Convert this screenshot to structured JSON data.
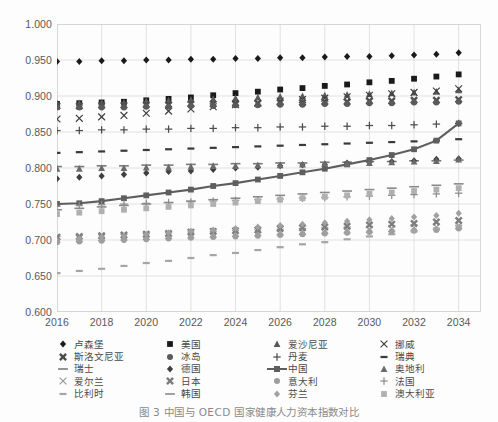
{
  "caption": "图 3 中国与 OECD 国家健康人力资本指数对比",
  "axes": {
    "y_ticks": [
      "1.000",
      "0.950",
      "0.900",
      "0.850",
      "0.800",
      "0.750",
      "0.700",
      "0.650",
      "0.600"
    ],
    "x_ticks": [
      "2016",
      "2018",
      "2020",
      "2022",
      "2024",
      "2026",
      "2028",
      "2030",
      "2032",
      "2034"
    ]
  },
  "legend": {
    "rows": [
      [
        {
          "label": "卢森堡",
          "marker": "diamond",
          "color": "#1a1a1a"
        },
        {
          "label": "美国",
          "marker": "square",
          "color": "#1a1a1a"
        },
        {
          "label": "爱沙尼亚",
          "marker": "triangle",
          "color": "#595959"
        },
        {
          "label": "挪威",
          "marker": "x-thin",
          "color": "#3f3f3f"
        }
      ],
      [
        {
          "label": "斯洛文尼亚",
          "marker": "x-bold",
          "color": "#4d4d4d"
        },
        {
          "label": "冰岛",
          "marker": "circle",
          "color": "#5a5a5a"
        },
        {
          "label": "丹麦",
          "marker": "plus",
          "color": "#4d4d4d"
        },
        {
          "label": "瑞典",
          "marker": "dash",
          "color": "#3a3a3a"
        }
      ],
      [
        {
          "label": "瑞士",
          "marker": "dash-long",
          "color": "#7a7a7a"
        },
        {
          "label": "德国",
          "marker": "diamond",
          "color": "#3f3f3f"
        },
        {
          "label": "中国",
          "marker": "line-square",
          "color": "#5e5e5e"
        },
        {
          "label": "奥地利",
          "marker": "triangle",
          "color": "#6a6a6a"
        }
      ],
      [
        {
          "label": "爱尔兰",
          "marker": "x-thin",
          "color": "#9a9a9a"
        },
        {
          "label": "日本",
          "marker": "x-bold",
          "color": "#7d7d7d"
        },
        {
          "label": "意大利",
          "marker": "circle",
          "color": "#9e9e9e"
        },
        {
          "label": "法国",
          "marker": "plus",
          "color": "#8d8d8d"
        }
      ],
      [
        {
          "label": "比利时",
          "marker": "dash",
          "color": "#a5a5a5"
        },
        {
          "label": "韩国",
          "marker": "dash-long",
          "color": "#8a8a8a"
        },
        {
          "label": "芬兰",
          "marker": "diamond",
          "color": "#a0a0a0"
        },
        {
          "label": "澳大利亚",
          "marker": "square",
          "color": "#b0b0b0"
        }
      ]
    ]
  },
  "chart_data": {
    "type": "scatter",
    "title": "",
    "xlabel": "",
    "ylabel": "",
    "xlim": [
      2016,
      2035
    ],
    "ylim": [
      0.6,
      1.0
    ],
    "ytick_step": 0.05,
    "grid": true,
    "legend_position": "bottom",
    "x": [
      2016,
      2017,
      2018,
      2019,
      2020,
      2021,
      2022,
      2023,
      2024,
      2025,
      2026,
      2027,
      2028,
      2029,
      2030,
      2031,
      2032,
      2033,
      2034
    ],
    "series": [
      {
        "name": "卢森堡",
        "marker": "diamond",
        "color": "#1a1a1a",
        "values": [
          0.948,
          0.948,
          0.949,
          0.949,
          0.95,
          0.95,
          0.951,
          0.951,
          0.952,
          0.952,
          0.953,
          0.953,
          0.954,
          0.955,
          0.955,
          0.956,
          0.957,
          0.958,
          0.96
        ]
      },
      {
        "name": "美国",
        "marker": "square",
        "color": "#1a1a1a",
        "values": [
          0.889,
          0.89,
          0.891,
          0.892,
          0.894,
          0.896,
          0.898,
          0.901,
          0.904,
          0.906,
          0.909,
          0.911,
          0.914,
          0.916,
          0.919,
          0.921,
          0.924,
          0.927,
          0.93
        ]
      },
      {
        "name": "爱沙尼亚",
        "marker": "triangle",
        "color": "#595959",
        "values": [
          0.89,
          0.89,
          0.891,
          0.891,
          0.893,
          0.894,
          0.895,
          0.896,
          0.897,
          0.898,
          0.899,
          0.9,
          0.901,
          0.902,
          0.903,
          0.904,
          0.905,
          0.906,
          0.908
        ]
      },
      {
        "name": "挪威",
        "marker": "x-thin",
        "color": "#3f3f3f",
        "values": [
          0.868,
          0.869,
          0.871,
          0.873,
          0.876,
          0.879,
          0.882,
          0.885,
          0.888,
          0.89,
          0.893,
          0.895,
          0.897,
          0.899,
          0.901,
          0.903,
          0.905,
          0.907,
          0.91
        ]
      },
      {
        "name": "斯洛文尼亚",
        "marker": "x-bold",
        "color": "#4d4d4d",
        "values": [
          0.886,
          0.886,
          0.887,
          0.887,
          0.888,
          0.888,
          0.889,
          0.889,
          0.89,
          0.89,
          0.891,
          0.891,
          0.892,
          0.892,
          0.893,
          0.893,
          0.894,
          0.894,
          0.895
        ]
      },
      {
        "name": "冰岛",
        "marker": "circle",
        "color": "#5a5a5a",
        "values": [
          0.884,
          0.884,
          0.884,
          0.884,
          0.885,
          0.885,
          0.886,
          0.886,
          0.887,
          0.887,
          0.888,
          0.888,
          0.889,
          0.889,
          0.89,
          0.89,
          0.891,
          0.891,
          0.892
        ]
      },
      {
        "name": "丹麦",
        "marker": "plus",
        "color": "#4d4d4d",
        "values": [
          0.852,
          0.852,
          0.853,
          0.853,
          0.854,
          0.854,
          0.855,
          0.855,
          0.856,
          0.856,
          0.857,
          0.857,
          0.858,
          0.858,
          0.859,
          0.859,
          0.86,
          0.861,
          0.862
        ]
      },
      {
        "name": "瑞典",
        "marker": "dash",
        "color": "#3a3a3a",
        "values": [
          0.821,
          0.822,
          0.823,
          0.824,
          0.825,
          0.826,
          0.827,
          0.828,
          0.829,
          0.83,
          0.831,
          0.832,
          0.833,
          0.834,
          0.835,
          0.836,
          0.837,
          0.838,
          0.84
        ]
      },
      {
        "name": "瑞士",
        "marker": "dash-long",
        "color": "#7a7a7a",
        "values": [
          0.802,
          0.802,
          0.803,
          0.803,
          0.804,
          0.804,
          0.805,
          0.805,
          0.806,
          0.806,
          0.807,
          0.807,
          0.808,
          0.808,
          0.809,
          0.809,
          0.81,
          0.81,
          0.811
        ]
      },
      {
        "name": "德国",
        "marker": "diamond",
        "color": "#3f3f3f",
        "values": [
          0.785,
          0.787,
          0.789,
          0.791,
          0.793,
          0.795,
          0.796,
          0.798,
          0.8,
          0.801,
          0.803,
          0.804,
          0.805,
          0.807,
          0.808,
          0.809,
          0.81,
          0.812,
          0.813
        ]
      },
      {
        "name": "中国",
        "marker": "line-square",
        "color": "#5e5e5e",
        "values": [
          0.75,
          0.751,
          0.754,
          0.758,
          0.762,
          0.766,
          0.77,
          0.775,
          0.779,
          0.784,
          0.789,
          0.794,
          0.799,
          0.805,
          0.811,
          0.818,
          0.826,
          0.838,
          0.862
        ]
      },
      {
        "name": "奥地利",
        "marker": "triangle",
        "color": "#6a6a6a",
        "values": [
          0.799,
          0.799,
          0.8,
          0.8,
          0.801,
          0.801,
          0.802,
          0.803,
          0.803,
          0.804,
          0.804,
          0.805,
          0.806,
          0.806,
          0.807,
          0.808,
          0.809,
          0.81,
          0.812
        ]
      },
      {
        "name": "爱尔兰",
        "marker": "x-thin",
        "color": "#9a9a9a",
        "values": [
          0.701,
          0.702,
          0.703,
          0.704,
          0.705,
          0.706,
          0.707,
          0.708,
          0.709,
          0.71,
          0.711,
          0.712,
          0.713,
          0.714,
          0.715,
          0.716,
          0.717,
          0.718,
          0.72
        ]
      },
      {
        "name": "日本",
        "marker": "x-bold",
        "color": "#7d7d7d",
        "values": [
          0.704,
          0.705,
          0.706,
          0.707,
          0.708,
          0.709,
          0.711,
          0.712,
          0.713,
          0.714,
          0.716,
          0.717,
          0.718,
          0.719,
          0.721,
          0.722,
          0.723,
          0.725,
          0.727
        ]
      },
      {
        "name": "意大利",
        "marker": "circle",
        "color": "#9e9e9e",
        "values": [
          0.697,
          0.698,
          0.699,
          0.7,
          0.701,
          0.702,
          0.703,
          0.704,
          0.705,
          0.706,
          0.707,
          0.708,
          0.709,
          0.71,
          0.711,
          0.712,
          0.713,
          0.714,
          0.716
        ]
      },
      {
        "name": "法国",
        "marker": "plus",
        "color": "#8d8d8d",
        "values": [
          0.747,
          0.748,
          0.749,
          0.75,
          0.751,
          0.752,
          0.753,
          0.754,
          0.755,
          0.756,
          0.757,
          0.758,
          0.759,
          0.76,
          0.761,
          0.762,
          0.763,
          0.764,
          0.765
        ]
      },
      {
        "name": "比利时",
        "marker": "dash",
        "color": "#a5a5a5",
        "values": [
          0.654,
          0.657,
          0.66,
          0.664,
          0.668,
          0.671,
          0.675,
          0.679,
          0.682,
          0.686,
          0.69,
          0.694,
          0.697,
          0.701,
          0.705,
          0.708,
          0.712,
          0.716,
          0.72
        ]
      },
      {
        "name": "韩国",
        "marker": "dash-long",
        "color": "#8a8a8a",
        "values": [
          0.742,
          0.744,
          0.746,
          0.748,
          0.75,
          0.752,
          0.754,
          0.756,
          0.758,
          0.76,
          0.762,
          0.764,
          0.766,
          0.768,
          0.77,
          0.772,
          0.774,
          0.776,
          0.778
        ]
      },
      {
        "name": "芬兰",
        "marker": "diamond",
        "color": "#a0a0a0",
        "values": [
          0.7,
          0.702,
          0.704,
          0.706,
          0.708,
          0.71,
          0.712,
          0.714,
          0.716,
          0.718,
          0.72,
          0.722,
          0.724,
          0.726,
          0.728,
          0.73,
          0.732,
          0.734,
          0.737
        ]
      },
      {
        "name": "澳大利亚",
        "marker": "square",
        "color": "#b0b0b0",
        "values": [
          0.736,
          0.738,
          0.74,
          0.742,
          0.744,
          0.746,
          0.748,
          0.75,
          0.752,
          0.754,
          0.756,
          0.758,
          0.76,
          0.762,
          0.764,
          0.766,
          0.768,
          0.77,
          0.772
        ]
      }
    ]
  }
}
